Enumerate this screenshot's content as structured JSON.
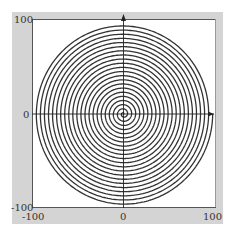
{
  "chart_data": {
    "type": "line",
    "subtype": "polar-spiral",
    "title": "",
    "xlabel": "",
    "ylabel": "",
    "xlim": [
      -100,
      100
    ],
    "ylim": [
      -100,
      100
    ],
    "x_ticks": [
      -100,
      0,
      100
    ],
    "y_ticks": [
      -100,
      0,
      100
    ],
    "x_tick_labels": [
      "-100",
      "0",
      "100"
    ],
    "y_tick_labels": [
      "-100",
      "0",
      "100"
    ],
    "grid": false,
    "legend": null,
    "series": [
      {
        "name": "spiral",
        "equation": "r = k*theta (Archimedean spiral)",
        "r_max": 98,
        "turns": 22,
        "color": "#333333"
      }
    ],
    "axes_arrows": true
  },
  "style": {
    "frame_color": "#d4d4d4",
    "plot_bg": "#ffffff",
    "axis_color": "#222222",
    "line_color": "#3a3a3a"
  }
}
